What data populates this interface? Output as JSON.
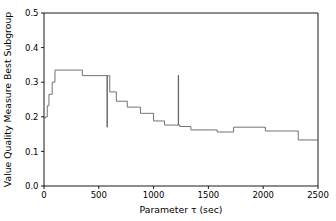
{
  "chart_data": {
    "type": "line",
    "title": "",
    "xlabel": "Parameter τ (sec)",
    "ylabel": "Value Quality Measure Best Subgroup",
    "xlim": [
      0,
      2500
    ],
    "ylim": [
      0.0,
      0.5
    ],
    "grid": false,
    "legend": null,
    "line_color": "#5a5a5a",
    "drawstyle": "steps-post",
    "xticks": [
      0,
      500,
      1000,
      1500,
      2000,
      2500
    ],
    "xtick_labels": [
      "0",
      "500",
      "1000",
      "1500",
      "2000",
      "2500"
    ],
    "yticks": [
      0.0,
      0.1,
      0.2,
      0.3,
      0.4,
      0.5
    ],
    "ytick_labels": [
      "0.0",
      "0.1",
      "0.2",
      "0.3",
      "0.4",
      "0.5"
    ],
    "series": [
      {
        "name": "Best Subgroup Quality",
        "x": [
          0,
          15,
          30,
          45,
          60,
          75,
          100,
          330,
          350,
          565,
          575,
          578,
          582,
          590,
          600,
          640,
          660,
          730,
          760,
          860,
          880,
          960,
          1000,
          1080,
          1100,
          1180,
          1225,
          1228,
          1232,
          1240,
          1310,
          1340,
          1560,
          1580,
          1710,
          1730,
          2000,
          2020,
          2300,
          2320,
          2500
        ],
        "y": [
          0.197,
          0.2,
          0.232,
          0.265,
          0.265,
          0.3,
          0.335,
          0.335,
          0.319,
          0.319,
          0.17,
          0.319,
          0.319,
          0.319,
          0.272,
          0.272,
          0.245,
          0.245,
          0.228,
          0.228,
          0.21,
          0.21,
          0.188,
          0.188,
          0.176,
          0.176,
          0.32,
          0.176,
          0.176,
          0.172,
          0.172,
          0.162,
          0.162,
          0.156,
          0.156,
          0.17,
          0.17,
          0.159,
          0.159,
          0.133,
          0.133
        ]
      }
    ],
    "annotations": [
      {
        "label": "downward spike",
        "x": 578,
        "y_min": 0.17,
        "y_max": 0.319
      },
      {
        "label": "upward spike",
        "x": 1228,
        "y_min": 0.176,
        "y_max": 0.32
      }
    ]
  },
  "geometry": {
    "plot_left": 44,
    "plot_right": 318,
    "plot_top": 13,
    "plot_bottom": 186
  }
}
